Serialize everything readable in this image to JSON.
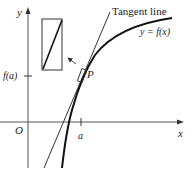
{
  "diagram": {
    "labels": {
      "y_axis": "y",
      "x_axis": "x",
      "origin": "O",
      "a_tick": "a",
      "fa_tick": "f(a)",
      "point": "P",
      "tangent": "Tangent line",
      "curve": "y = f(x)"
    },
    "colors": {
      "stroke": "#1a1a1a",
      "axis": "#555555",
      "background": "#ffffff"
    },
    "elements": [
      "coordinate axes",
      "curve y = f(x)",
      "tangent line through P",
      "small box at P",
      "magnified inset rectangle",
      "arrow from box to inset"
    ]
  }
}
